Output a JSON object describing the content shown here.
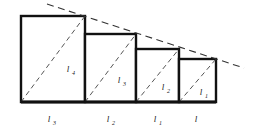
{
  "figure": {
    "background_color": "#ffffff",
    "stroke_color": "#111111",
    "dashed_color": "#444444",
    "baseline_y": 102,
    "baseline_x_start": 21,
    "baseline_x_end": 216,
    "rectangles": [
      {
        "name": "rect-1",
        "x": 21,
        "y": 16,
        "width": 64,
        "height": 86,
        "inner_label": "l",
        "inner_subscript": "4",
        "inner_label_x": 68,
        "inner_label_y": 72,
        "bottom_label": "l",
        "bottom_subscript": "3",
        "bottom_label_x": 49,
        "bottom_label_y": 122
      },
      {
        "name": "rect-2",
        "x": 85,
        "y": 34,
        "width": 51,
        "height": 68,
        "inner_label": "l",
        "inner_subscript": "3",
        "inner_label_x": 119,
        "inner_label_y": 83,
        "bottom_label": "l",
        "bottom_subscript": "2",
        "bottom_label_x": 108,
        "bottom_label_y": 122
      },
      {
        "name": "rect-3",
        "x": 136,
        "y": 49,
        "width": 43,
        "height": 53,
        "inner_label": "l",
        "inner_subscript": "2",
        "inner_label_x": 163,
        "inner_label_y": 90,
        "bottom_label": "l",
        "bottom_subscript": "1",
        "bottom_label_x": 155,
        "bottom_label_y": 122
      },
      {
        "name": "rect-4",
        "x": 179,
        "y": 59,
        "width": 37,
        "height": 43,
        "inner_label": "l",
        "inner_subscript": "1",
        "inner_label_x": 201,
        "inner_label_y": 95,
        "bottom_label": "l",
        "bottom_subscript": "",
        "bottom_label_x": 196,
        "bottom_label_y": 122
      }
    ],
    "tangent_line": {
      "name": "tangent-dashed-line",
      "x1": 47,
      "y1": 4,
      "x2": 244,
      "y2": 68
    }
  }
}
